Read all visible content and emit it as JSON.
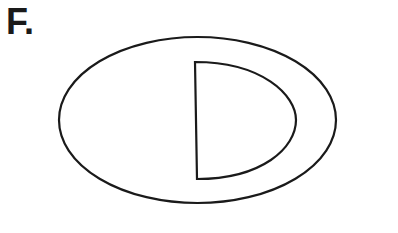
{
  "figure": {
    "label": "F.",
    "stroke_color": "#1a1a1a",
    "background": "#ffffff"
  },
  "shapes": {
    "outer_ellipse": {
      "cx": 197.5,
      "cy": 120,
      "rx": 138.5,
      "ry": 83
    },
    "inner_d_shape": {
      "top": [
        195,
        62
      ],
      "bottom": [
        197,
        179
      ],
      "rightmost": [
        296,
        120
      ]
    }
  }
}
